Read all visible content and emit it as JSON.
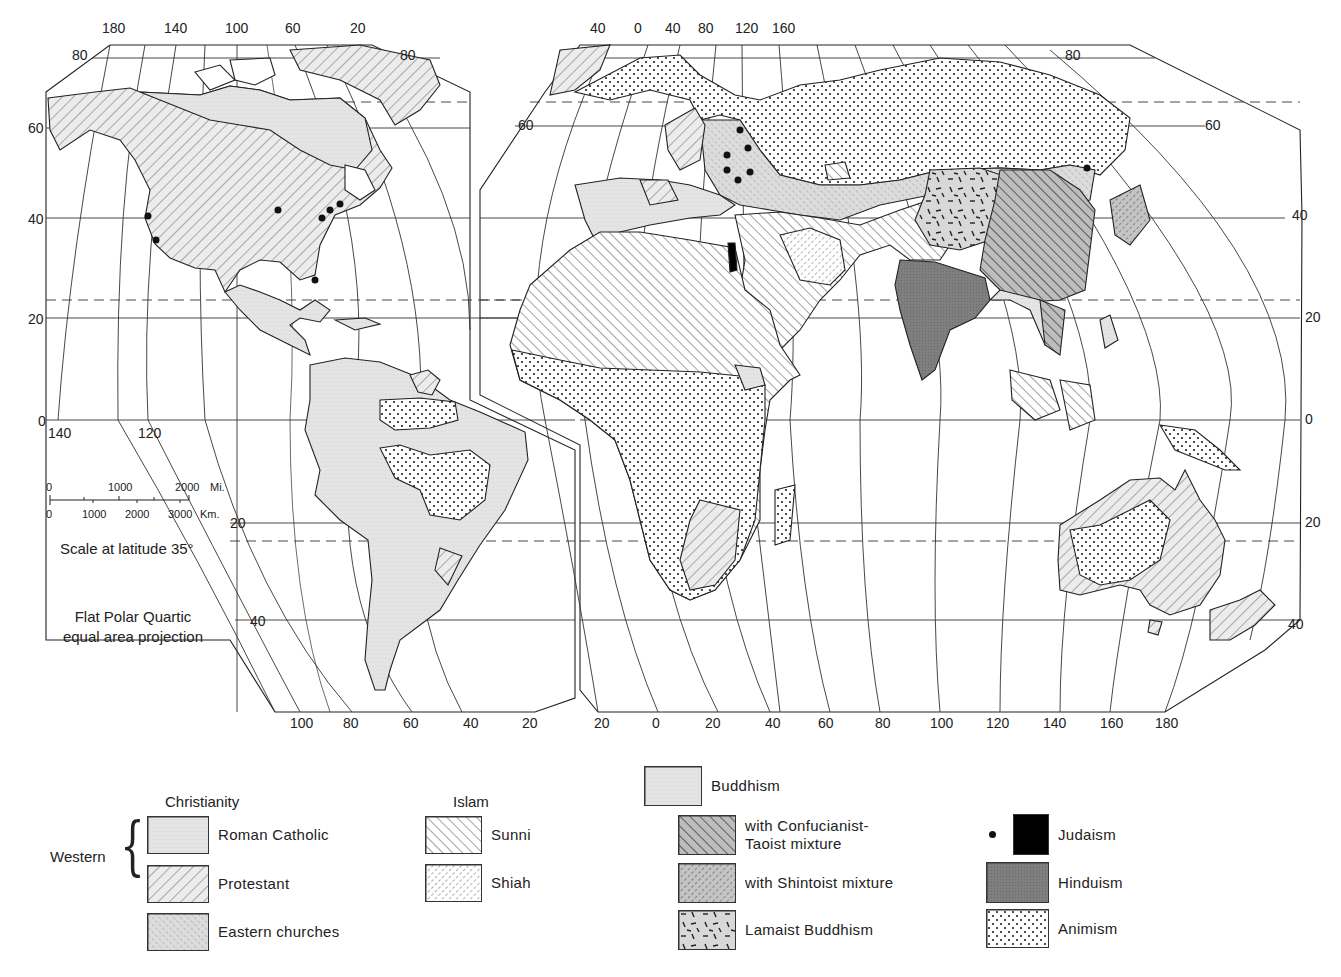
{
  "map": {
    "title": "World Religions",
    "projection_note": [
      "Flat Polar Quartic",
      "equal area projection"
    ],
    "scale": {
      "miles_ticks": [
        "0",
        "1000",
        "2000"
      ],
      "miles_unit": "Mi.",
      "km_ticks": [
        "0",
        "1000",
        "2000",
        "3000"
      ],
      "km_unit": "Km.",
      "caption": "Scale at latitude 35°"
    },
    "west_panel": {
      "top_longitudes": [
        "180",
        "140",
        "100",
        "60",
        "20"
      ],
      "bottom_longitudes": [
        "100",
        "80",
        "60",
        "40",
        "20"
      ],
      "equator_longitudes": [
        "140",
        "120"
      ],
      "left_latitudes": [
        "80",
        "60",
        "40",
        "20",
        "0"
      ],
      "right_latitudes": [
        "80"
      ],
      "inner_latitudes": [
        "20",
        "40"
      ]
    },
    "east_panel": {
      "top_longitudes": [
        "40",
        "0",
        "40",
        "80",
        "120",
        "160"
      ],
      "bottom_longitudes": [
        "20",
        "0",
        "20",
        "40",
        "60",
        "80",
        "100",
        "120",
        "140",
        "160",
        "180"
      ],
      "left_latitudes": [
        "60"
      ],
      "right_latitudes": [
        "80",
        "60",
        "40",
        "20",
        "0",
        "20",
        "40"
      ]
    }
  },
  "legend": {
    "christianity": {
      "heading": "Christianity",
      "group_label": "Western",
      "items": [
        {
          "label": "Roman Catholic",
          "pattern": "roman-catholic"
        },
        {
          "label": "Protestant",
          "pattern": "protestant"
        },
        {
          "label": "Eastern churches",
          "pattern": "eastern"
        }
      ]
    },
    "islam": {
      "heading": "Islam",
      "items": [
        {
          "label": "Sunni",
          "pattern": "sunni"
        },
        {
          "label": "Shiah",
          "pattern": "shiah"
        }
      ]
    },
    "buddhism": {
      "heading": "Buddhism",
      "items": [
        {
          "label_line1": "with Confucianist-",
          "label_line2": "Taoist mixture",
          "pattern": "confucian"
        },
        {
          "label": "with Shintoist mixture",
          "pattern": "shinto"
        },
        {
          "label": "Lamaist Buddhism",
          "pattern": "lamaist"
        }
      ]
    },
    "other": {
      "items": [
        {
          "label": "Judaism",
          "pattern": "judaism",
          "symbol": "dot"
        },
        {
          "label": "Hinduism",
          "pattern": "hinduism"
        },
        {
          "label": "Animism",
          "pattern": "animism"
        }
      ]
    }
  },
  "colors": {
    "land_light": "#e6e6e6",
    "hinduism": "#7d7d7d",
    "judaism": "#000000",
    "line": "#222222"
  }
}
